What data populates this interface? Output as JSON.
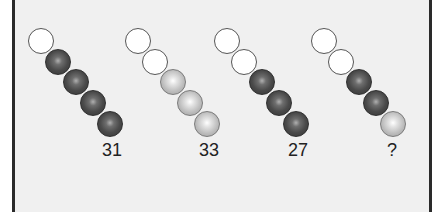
{
  "puzzle": {
    "colors": {
      "panel_background": "#f0f0f0",
      "border": "#2a2a2a",
      "white_ball": "#ffffff",
      "dark_ball": "#4a4a4a",
      "light_ball": "#c4c4c4"
    },
    "groups": [
      {
        "label": "31",
        "balls": [
          "white",
          "dark",
          "dark",
          "dark",
          "dark"
        ],
        "x0": 28,
        "label_x": 102
      },
      {
        "label": "33",
        "balls": [
          "white",
          "white",
          "light",
          "light",
          "light"
        ],
        "x0": 125,
        "label_x": 199
      },
      {
        "label": "27",
        "balls": [
          "white",
          "white",
          "dark",
          "dark",
          "dark"
        ],
        "x0": 214,
        "label_x": 288
      },
      {
        "label": "?",
        "balls": [
          "white",
          "white",
          "dark",
          "dark",
          "light"
        ],
        "x0": 311,
        "label_x": 387
      }
    ]
  }
}
